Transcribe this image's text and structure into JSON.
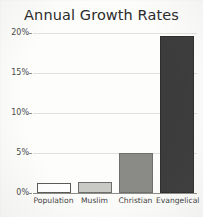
{
  "chart_data": {
    "type": "bar",
    "title": "Annual Growth Rates",
    "xlabel": "",
    "ylabel": "",
    "categories": [
      "Population",
      "Muslim",
      "Christian",
      "Evangelical"
    ],
    "values": [
      1.3,
      1.4,
      5.0,
      19.6
    ],
    "value_labels": [
      "1.3%",
      "1.4%",
      "5%",
      "19.6%"
    ],
    "series": [
      {
        "name": "Annual Growth Rate",
        "values": [
          1.3,
          1.4,
          5.0,
          19.6
        ]
      }
    ],
    "ylim": [
      0,
      20
    ],
    "ytick_values": [
      0,
      5,
      10,
      15,
      20
    ],
    "ytick_labels": [
      "0%",
      "5%",
      "10%",
      "15%",
      "20%"
    ],
    "grid": true,
    "legend": false,
    "legend_position": "none",
    "bar_colors": [
      "#ffffff",
      "#c9c9c6",
      "#8a8a87",
      "#3c3c3c"
    ],
    "bar_edge_colors": [
      "#5a5a57",
      "#6e6e6b",
      "#6e6e6b",
      "#2e2e2e"
    ],
    "axis_color": "#8d8d8a",
    "gridline_color": "#e0e0de",
    "background_color": "#fdfdfc",
    "title_color": "#2b2b2b"
  }
}
